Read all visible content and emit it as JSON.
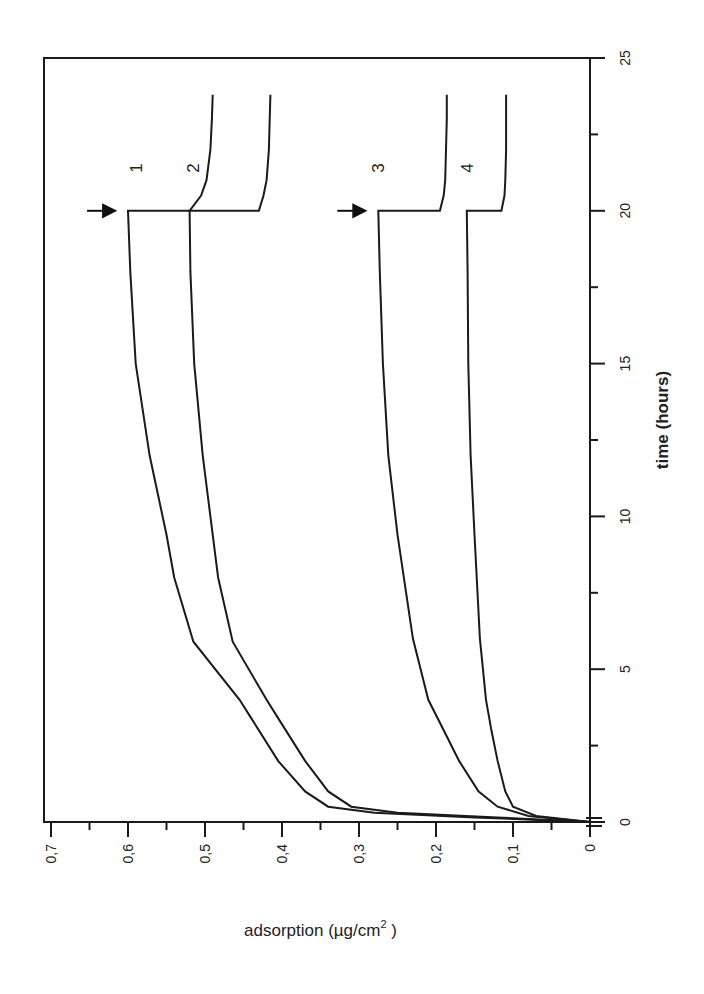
{
  "chart_data": {
    "type": "line",
    "title": "",
    "xlabel": "time (hours)",
    "ylabel": "adsorption (µg/cm²)",
    "ylabel_main": "adsorption (µg/cm",
    "ylabel_sup": "2",
    "ylabel_close": " )",
    "xlim": [
      0,
      25
    ],
    "ylim": [
      0,
      0.7
    ],
    "x_ticks": [
      0,
      5,
      10,
      15,
      20,
      25
    ],
    "x_tick_labels": [
      "0",
      "5",
      "10",
      "15",
      "20",
      "25"
    ],
    "y_ticks": [
      0,
      0.1,
      0.2,
      0.3,
      0.4,
      0.5,
      0.6,
      0.7
    ],
    "y_tick_labels": [
      "0",
      "0,1",
      "0,2",
      "0,3",
      "0,4",
      "0,5",
      "0,6",
      "0,7"
    ],
    "grid": false,
    "orientation": "rotated 90° counter-clockwise",
    "annotations": [
      {
        "type": "arrow",
        "x": 20,
        "y": 0.635,
        "target_series": "1",
        "meaning": "step change at t=20h"
      },
      {
        "type": "arrow",
        "x": 20,
        "y": 0.31,
        "target_series": "3",
        "meaning": "step change at t=20h"
      }
    ],
    "series": [
      {
        "name": "1",
        "label_pos": {
          "x": 21.4,
          "y": 0.59
        },
        "x": [
          0,
          0.15,
          0.3,
          0.5,
          1,
          2,
          3.4,
          4,
          5.9,
          8,
          9.4,
          12,
          15,
          18,
          20,
          20.001,
          20.5,
          21,
          22,
          23,
          23.8
        ],
        "y": [
          0,
          0.15,
          0.28,
          0.34,
          0.37,
          0.405,
          0.44,
          0.455,
          0.515,
          0.54,
          0.55,
          0.572,
          0.59,
          0.597,
          0.6,
          0.52,
          0.505,
          0.498,
          0.493,
          0.491,
          0.49
        ]
      },
      {
        "name": "2",
        "label_pos": {
          "x": 21.4,
          "y": 0.515
        },
        "x": [
          0,
          0.15,
          0.3,
          0.5,
          1,
          2,
          3.4,
          4,
          5.9,
          8,
          9.4,
          12,
          15,
          18,
          20,
          20.001,
          20.5,
          21,
          22,
          23,
          23.8
        ],
        "y": [
          0,
          0.12,
          0.25,
          0.31,
          0.34,
          0.37,
          0.405,
          0.42,
          0.464,
          0.483,
          0.49,
          0.503,
          0.514,
          0.519,
          0.52,
          0.43,
          0.424,
          0.42,
          0.417,
          0.416,
          0.415
        ]
      },
      {
        "name": "3",
        "label_pos": {
          "x": 21.4,
          "y": 0.275
        },
        "x": [
          0,
          0.2,
          0.5,
          1,
          2,
          3,
          4,
          6,
          9.4,
          12,
          15,
          18,
          20,
          20.001,
          20.5,
          21,
          22,
          23,
          23.8
        ],
        "y": [
          0,
          0.08,
          0.12,
          0.145,
          0.17,
          0.19,
          0.21,
          0.23,
          0.25,
          0.262,
          0.269,
          0.273,
          0.275,
          0.195,
          0.19,
          0.188,
          0.187,
          0.186,
          0.186
        ]
      },
      {
        "name": "4",
        "label_pos": {
          "x": 21.4,
          "y": 0.16
        },
        "x": [
          0,
          0.2,
          0.5,
          1,
          2,
          3,
          4,
          6,
          9.4,
          12,
          15,
          18,
          20,
          20.001,
          20.5,
          21,
          22,
          23,
          23.8
        ],
        "y": [
          0,
          0.07,
          0.1,
          0.11,
          0.12,
          0.128,
          0.135,
          0.143,
          0.15,
          0.155,
          0.158,
          0.159,
          0.16,
          0.115,
          0.111,
          0.11,
          0.109,
          0.109,
          0.109
        ]
      }
    ]
  }
}
